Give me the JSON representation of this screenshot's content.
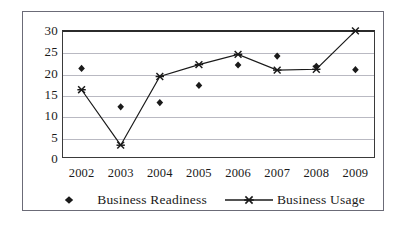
{
  "chart_data": {
    "type": "line",
    "title": "",
    "xlabel": "",
    "ylabel": "",
    "categories": [
      "2002",
      "2003",
      "2004",
      "2005",
      "2006",
      "2007",
      "2008",
      "2009"
    ],
    "ylim": [
      0,
      30
    ],
    "yticks": [
      0,
      5,
      10,
      15,
      20,
      25,
      30
    ],
    "grid": true,
    "legend_position": "bottom",
    "series": [
      {
        "name": "Business Readiness",
        "marker": "diamond",
        "line": "none",
        "color": "#1a1a1a",
        "values": [
          21.0,
          12.0,
          13.0,
          17.0,
          21.8,
          23.9,
          21.5,
          20.7
        ]
      },
      {
        "name": "Business Usage",
        "marker": "x",
        "line": "solid",
        "color": "#1a1a1a",
        "values": [
          16.0,
          3.0,
          19.1,
          21.9,
          24.3,
          20.6,
          20.8,
          29.8
        ]
      }
    ]
  },
  "axes": {
    "y_tick_labels": [
      "30",
      "25",
      "20",
      "15",
      "10",
      "5",
      "0"
    ],
    "x_tick_labels": [
      "2002",
      "2003",
      "2004",
      "2005",
      "2006",
      "2007",
      "2008",
      "2009"
    ]
  },
  "legend": {
    "items": [
      {
        "label": "Business Readiness",
        "marker": "diamond-marker-icon"
      },
      {
        "label": "Business Usage",
        "marker": "x-line-marker-icon"
      }
    ]
  },
  "colors": {
    "frame": "#6b6b77",
    "axis": "#2b2b2b",
    "gridline": "#b9b9c2",
    "series": "#1a1a1a",
    "background": "#ffffff"
  }
}
